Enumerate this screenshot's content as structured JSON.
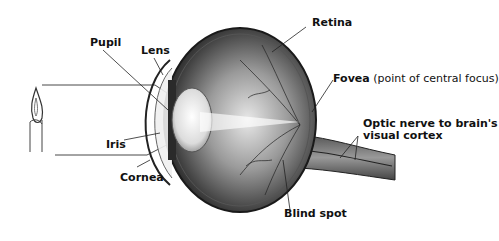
{
  "diagram": {
    "title": "",
    "type": "anatomical eye cross-section",
    "labels": {
      "pupil": "Pupil",
      "lens": "Lens",
      "retina": "Retina",
      "fovea": "Fovea",
      "fovea_note": "(point of central focus)",
      "optic_nerve_line1": "Optic nerve to brain's",
      "optic_nerve_line2": "visual cortex",
      "iris": "Iris",
      "cornea": "Cornea",
      "blind_spot": "Blind spot"
    },
    "elements": [
      "candle-object",
      "light-rays",
      "cornea",
      "iris",
      "pupil",
      "lens",
      "vitreous-body",
      "retina",
      "fovea",
      "optic-nerve",
      "blind-spot"
    ],
    "colors": {
      "background": "#ffffff",
      "ink": "#111111",
      "eye_dark": "#2a2a2a",
      "eye_mid": "#7a7a7a",
      "eye_light": "#d9d9d9"
    }
  }
}
